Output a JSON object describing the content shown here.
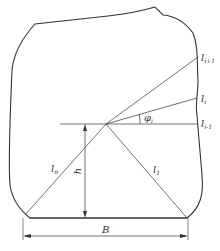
{
  "diagram": {
    "stroke_color": "#333333",
    "labels": {
      "l_i_plus_1": {
        "base": "l",
        "sub": "i+1"
      },
      "l_i": {
        "base": "l",
        "sub": "i"
      },
      "l_i_minus_1": {
        "base": "l",
        "sub": "i-1"
      },
      "phi_i": {
        "base": "φ",
        "sub": "i"
      },
      "l_n": {
        "base": "l",
        "sub": "n"
      },
      "h": {
        "base": "h",
        "sub": ""
      },
      "l_1": {
        "base": "l",
        "sub": "1"
      },
      "B": {
        "base": "B",
        "sub": ""
      }
    }
  }
}
